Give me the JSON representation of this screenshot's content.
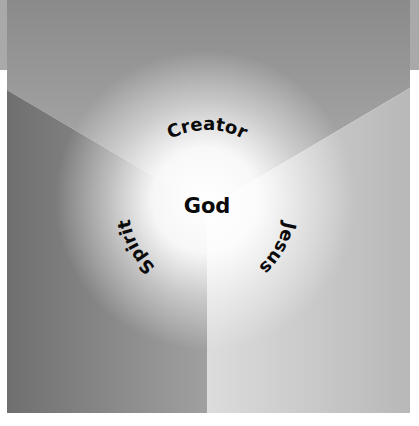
{
  "diagram": {
    "center_label": "God",
    "arc_labels": [
      {
        "text": "Creator",
        "position": "top"
      },
      {
        "text": "Jesus",
        "position": "right"
      },
      {
        "text": "Spirit",
        "position": "left"
      }
    ],
    "regions": [
      {
        "name": "top",
        "color_edge": "#8c8c8c"
      },
      {
        "name": "left",
        "color_edge": "#6e6e6e"
      },
      {
        "name": "right",
        "color_edge": "#bcbcbc"
      }
    ],
    "glow_color": "#ffffff",
    "text_color": "#0a0a0a"
  }
}
